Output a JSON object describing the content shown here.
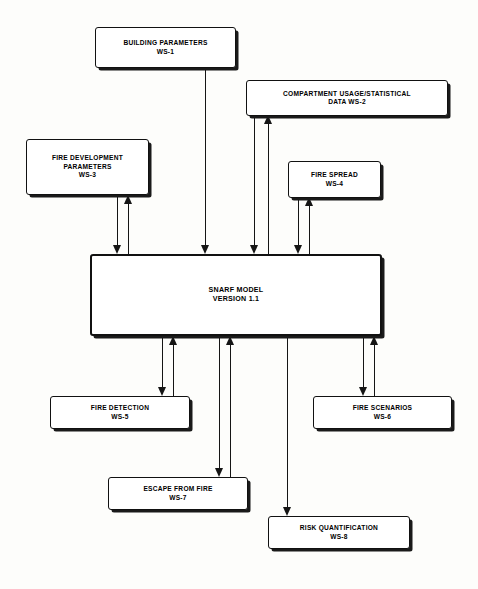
{
  "diagram": {
    "background_color": "#fdfdfb",
    "line_color": "#151515",
    "box_border_color": "#111111",
    "nodes": [
      {
        "id": "ws1",
        "name": "building-parameters",
        "line1": "BUILDING PARAMETERS",
        "line2": "WS-1"
      },
      {
        "id": "ws2",
        "name": "compartment-usage-statistical-data",
        "line1": "COMPARTMENT USAGE/STATISTICAL",
        "line2": "DATA WS-2"
      },
      {
        "id": "ws3",
        "name": "fire-development-parameters",
        "line1": "FIRE DEVELOPMENT",
        "line2": "PARAMETERS",
        "line3": "WS-3"
      },
      {
        "id": "ws4",
        "name": "fire-spread",
        "line1": "FIRE SPREAD",
        "line2": "WS-4"
      },
      {
        "id": "snarf",
        "name": "snarf-model",
        "line1": "SNARF MODEL",
        "line2": "VERSION 1.1"
      },
      {
        "id": "ws5",
        "name": "fire-detection",
        "line1": "FIRE DETECTION",
        "line2": "WS-5"
      },
      {
        "id": "ws6",
        "name": "fire-scenarios",
        "line1": "FIRE SCENARIOS",
        "line2": "WS-6"
      },
      {
        "id": "ws7",
        "name": "escape-from-fire",
        "line1": "ESCAPE FROM FIRE",
        "line2": "WS-7"
      },
      {
        "id": "ws8",
        "name": "risk-quantification",
        "line1": "RISK QUANTIFICATION",
        "line2": "WS-8"
      }
    ],
    "connections": [
      {
        "from": "ws1",
        "to": "snarf",
        "direction": "down"
      },
      {
        "from": "ws2",
        "to": "snarf",
        "direction": "down"
      },
      {
        "from": "snarf",
        "to": "ws2",
        "direction": "up"
      },
      {
        "from": "ws3",
        "to": "snarf",
        "direction": "down"
      },
      {
        "from": "snarf",
        "to": "ws3",
        "direction": "up"
      },
      {
        "from": "ws4",
        "to": "snarf",
        "direction": "down"
      },
      {
        "from": "snarf",
        "to": "ws4",
        "direction": "up"
      },
      {
        "from": "snarf",
        "to": "ws5",
        "direction": "down"
      },
      {
        "from": "ws5",
        "to": "snarf",
        "direction": "up"
      },
      {
        "from": "snarf",
        "to": "ws7",
        "direction": "down"
      },
      {
        "from": "ws7",
        "to": "snarf",
        "direction": "up"
      },
      {
        "from": "snarf",
        "to": "ws8",
        "direction": "down"
      },
      {
        "from": "snarf",
        "to": "ws6",
        "direction": "down"
      },
      {
        "from": "ws6",
        "to": "snarf",
        "direction": "up"
      }
    ]
  }
}
